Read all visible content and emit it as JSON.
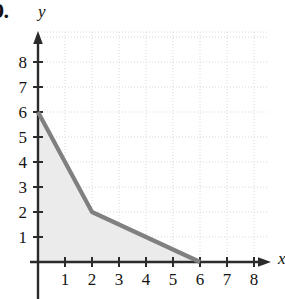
{
  "figure": {
    "problem_number": "9.",
    "y_axis_label": "y",
    "x_axis_label": "x"
  },
  "style": {
    "curve_color": "#808080",
    "shade_color": "#ebebeb",
    "axis_color": "#2b2b2b",
    "grid_color": "#d8d8d8",
    "background": "#ffffff"
  },
  "chart_data": {
    "type": "area",
    "title": "",
    "xlabel": "x",
    "ylabel": "y",
    "xlim": [
      0,
      9
    ],
    "ylim": [
      0,
      9
    ],
    "xticks": [
      1,
      2,
      3,
      4,
      5,
      6,
      7,
      8
    ],
    "yticks": [
      1,
      2,
      3,
      4,
      5,
      6,
      7,
      8
    ],
    "xtick_labels": [
      "1",
      "2",
      "3",
      "4",
      "5",
      "6",
      "7",
      "8"
    ],
    "ytick_labels": [
      "1",
      "2",
      "3",
      "4",
      "5",
      "6",
      "7",
      "8"
    ],
    "grid": true,
    "grid_style": "dotted",
    "legend": false,
    "shaded_region": true,
    "series": [
      {
        "name": "piecewise-linear curve",
        "x": [
          0,
          2,
          6
        ],
        "y": [
          6,
          2,
          0
        ],
        "points": [
          [
            0,
            6
          ],
          [
            2,
            2
          ],
          [
            6,
            0
          ]
        ]
      }
    ],
    "annotations": []
  }
}
